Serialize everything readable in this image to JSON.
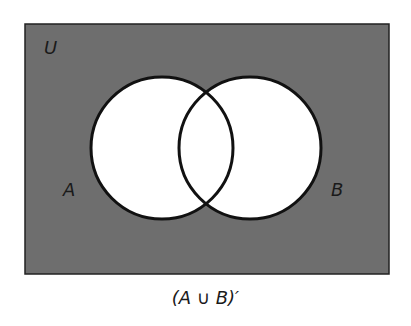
{
  "diagram": {
    "type": "venn",
    "universe_label": "U",
    "set_a_label": "A",
    "set_b_label": "B",
    "caption": "(A ∪ B)′",
    "colors": {
      "universe_fill": "#6e6e6e",
      "set_fill": "#ffffff",
      "outline": "#111111"
    },
    "shaded_region": "complement of A union B"
  }
}
